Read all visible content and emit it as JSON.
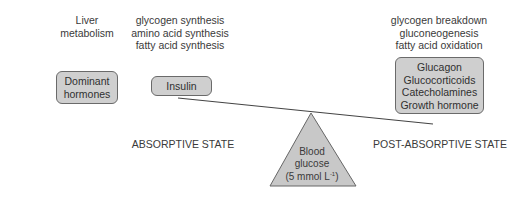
{
  "left_column": {
    "heading_lines": [
      "Liver",
      "metabolism"
    ],
    "box_lines": [
      "Dominant",
      "hormones"
    ]
  },
  "absorptive": {
    "processes": [
      "glycogen synthesis",
      "amino acid synthesis",
      "fatty acid synthesis"
    ],
    "hormone": "Insulin",
    "state_label": "ABSORPTIVE STATE"
  },
  "post_absorptive": {
    "processes": [
      "glycogen breakdown",
      "gluconeogenesis",
      "fatty acid oxidation"
    ],
    "hormones": [
      "Glucagon",
      "Glucocorticoids",
      "Catecholamines",
      "Growth hormone"
    ],
    "state_label": "POST-ABSORPTIVE STATE"
  },
  "fulcrum": {
    "lines": [
      "Blood",
      "glucose"
    ],
    "value_prefix": "(5 mmol L",
    "value_superscript": "-1",
    "value_suffix": ")"
  },
  "colors": {
    "box_fill": "#cfcfcf",
    "box_border": "#6a6a6a",
    "triangle_fill": "#c8c8c8",
    "lever": "#444444"
  }
}
